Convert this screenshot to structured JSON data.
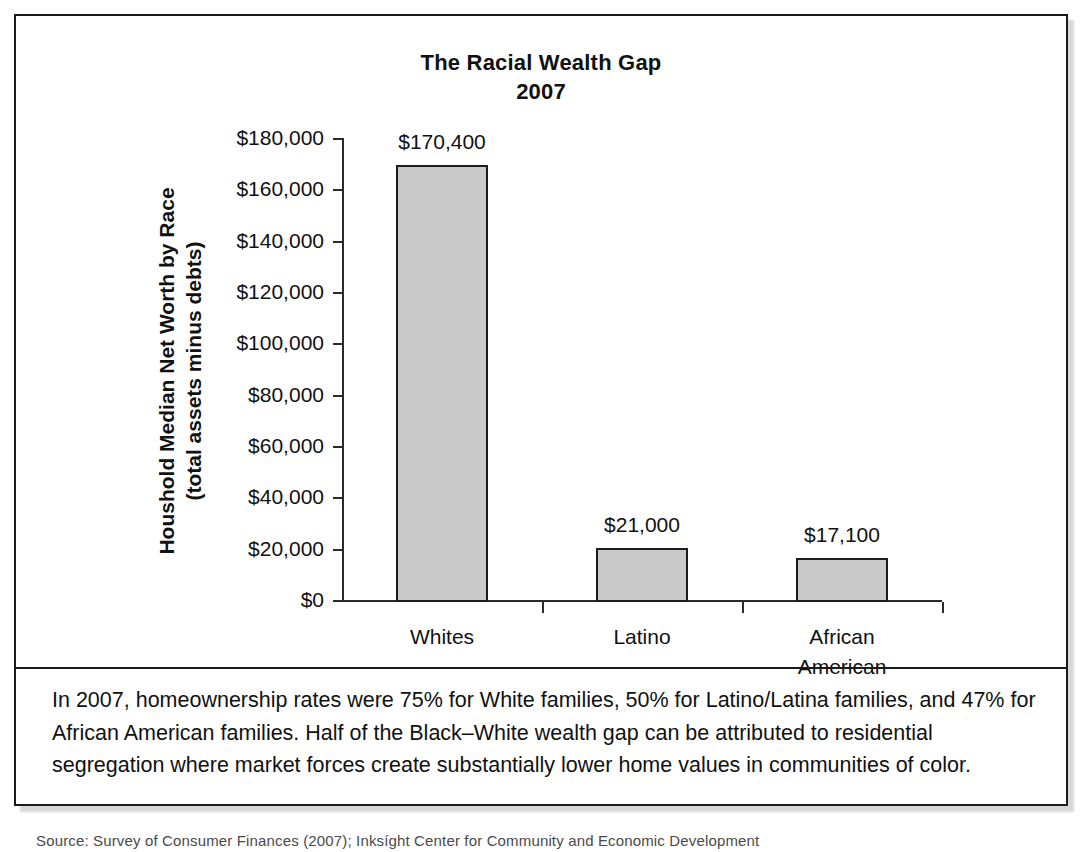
{
  "figure": {
    "title_line1": "The Racial Wealth Gap",
    "title_line2": "2007",
    "y_axis_title_line1": "Houshold Median Net Worth by Race",
    "y_axis_title_line2": "(total assets minus debts)",
    "caption": "In 2007, homeownership rates were 75% for White families, 50% for Latino/Latina families, and 47% for African American families. Half of the Black–White wealth gap can be attributed to residential segregation where market forces create substantially lower home values in communities of color.",
    "source_note": "Source: Survey of Consumer Finances (2007); Inksíght Center for Community and Economic Development"
  },
  "colors": {
    "bar_fill": "#c9c9c9",
    "bar_border": "#1c1c1c",
    "axis": "#2b2b2b",
    "frame": "#1a1a1a",
    "text": "#111111"
  },
  "chart_data": {
    "type": "bar",
    "title": "The Racial Wealth Gap 2007",
    "xlabel": "",
    "ylabel": "Houshold Median Net Worth by Race (total assets minus debts)",
    "ylim": [
      0,
      180000
    ],
    "ytick_values": [
      0,
      20000,
      40000,
      60000,
      80000,
      100000,
      120000,
      140000,
      160000,
      180000
    ],
    "ytick_labels": [
      "$0",
      "$20,000",
      "$40,000",
      "$60,000",
      "$80,000",
      "$100,000",
      "$120,000",
      "$140,000",
      "$160,000",
      "$180,000"
    ],
    "grid": false,
    "legend": "none",
    "categories": [
      "Whites",
      "Latino",
      "African American"
    ],
    "category_label_lines": [
      [
        "Whites"
      ],
      [
        "Latino"
      ],
      [
        "African",
        "American"
      ]
    ],
    "values": [
      170400,
      21000,
      17100
    ],
    "value_labels": [
      "$170,400",
      "$21,000",
      "$17,100"
    ]
  }
}
